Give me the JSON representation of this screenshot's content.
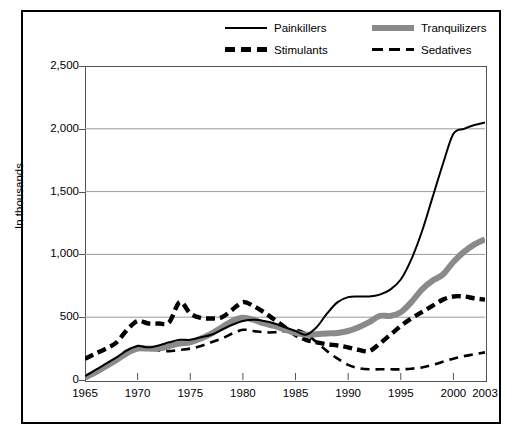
{
  "chart_data": {
    "type": "line",
    "title": "",
    "xlabel": "",
    "ylabel": "In thousands",
    "xlim": [
      1965,
      2003
    ],
    "ylim": [
      0,
      2500
    ],
    "grid": "horizontal",
    "legend_position": "top",
    "x_ticks": [
      "1965",
      "1970",
      "1975",
      "1980",
      "1985",
      "1990",
      "1995",
      "2000",
      "2003"
    ],
    "x_tick_values": [
      1965,
      1970,
      1975,
      1980,
      1985,
      1990,
      1995,
      2000,
      2003
    ],
    "y_ticks": [
      "0",
      "500",
      "1,000",
      "1,500",
      "2,000",
      "2,500"
    ],
    "y_tick_values": [
      0,
      500,
      1000,
      1500,
      2000,
      2500
    ],
    "x": [
      1965,
      1966,
      1967,
      1968,
      1969,
      1970,
      1971,
      1972,
      1973,
      1974,
      1975,
      1976,
      1977,
      1978,
      1979,
      1980,
      1981,
      1982,
      1983,
      1984,
      1985,
      1986,
      1987,
      1988,
      1989,
      1990,
      1991,
      1992,
      1993,
      1994,
      1995,
      1996,
      1997,
      1998,
      1999,
      2000,
      2001,
      2002,
      2003
    ],
    "series": [
      {
        "name": "Painkillers",
        "style": "solid-thin",
        "color": "#000000",
        "values": [
          30,
          80,
          130,
          180,
          235,
          270,
          260,
          275,
          300,
          320,
          320,
          340,
          360,
          400,
          440,
          470,
          480,
          470,
          450,
          420,
          390,
          360,
          420,
          530,
          620,
          660,
          665,
          665,
          680,
          720,
          800,
          960,
          1180,
          1450,
          1720,
          1960,
          2000,
          2030,
          2050
        ]
      },
      {
        "name": "Tranquilizers",
        "style": "solid-thick",
        "color": "#8a8a8a",
        "values": [
          20,
          60,
          110,
          160,
          215,
          250,
          250,
          250,
          270,
          290,
          300,
          330,
          370,
          420,
          470,
          495,
          480,
          450,
          430,
          400,
          375,
          360,
          365,
          370,
          375,
          390,
          420,
          460,
          510,
          510,
          540,
          620,
          720,
          790,
          840,
          940,
          1020,
          1080,
          1120
        ]
      },
      {
        "name": "Stimulants",
        "style": "dash-thick",
        "color": "#000000",
        "values": [
          170,
          210,
          250,
          300,
          400,
          470,
          450,
          450,
          460,
          620,
          530,
          495,
          490,
          500,
          560,
          620,
          590,
          540,
          480,
          420,
          360,
          320,
          300,
          285,
          275,
          260,
          240,
          230,
          290,
          360,
          430,
          490,
          540,
          590,
          640,
          665,
          665,
          650,
          640
        ]
      },
      {
        "name": "Sedatives",
        "style": "dash-thin",
        "color": "#000000",
        "values": [
          30,
          70,
          120,
          175,
          235,
          270,
          255,
          235,
          230,
          240,
          250,
          270,
          300,
          330,
          370,
          400,
          390,
          380,
          380,
          390,
          400,
          370,
          300,
          230,
          170,
          120,
          95,
          85,
          85,
          85,
          85,
          90,
          100,
          120,
          145,
          170,
          190,
          205,
          220
        ]
      }
    ]
  },
  "legend": {
    "items": [
      {
        "label": "Painkillers",
        "style": "solid-thin"
      },
      {
        "label": "Tranquilizers",
        "style": "solid-thick"
      },
      {
        "label": "Stimulants",
        "style": "dash-thick"
      },
      {
        "label": "Sedatives",
        "style": "dash-thin"
      }
    ]
  },
  "axis": {
    "y_title": "In thousands"
  },
  "colors": {
    "painkillers": "#000000",
    "tranquilizers": "#8a8a8a",
    "stimulants": "#000000",
    "sedatives": "#000000",
    "grid": "#9a9a9a",
    "frame": "#000000"
  }
}
